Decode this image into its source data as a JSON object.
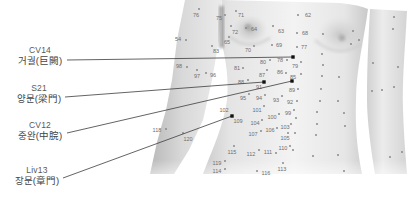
{
  "figure": {
    "annotations": [
      {
        "code": "CV14",
        "name": "거궐(巨闕)"
      },
      {
        "code": "S21",
        "name": "양문(梁門)"
      },
      {
        "code": "CV12",
        "name": "중완(中脘)"
      },
      {
        "code": "Liv13",
        "name": "장문(章門)"
      }
    ],
    "point_numbers": [
      "76",
      "54",
      "98",
      "97",
      "96",
      "118",
      "120",
      "75",
      "71",
      "72",
      "64",
      "65",
      "83",
      "63",
      "62",
      "68",
      "69",
      "77",
      "70",
      "80",
      "78",
      "79",
      "81",
      "87",
      "86",
      "85",
      "88",
      "91",
      "89",
      "95",
      "94",
      "93",
      "92",
      "101",
      "102",
      "100",
      "99",
      "109",
      "104",
      "103",
      "106",
      "107",
      "105",
      "110",
      "115",
      "112",
      "111",
      "113",
      "119",
      "114",
      "116"
    ],
    "colors": {
      "marker": "#111111",
      "leader_line": "#3c3c3c",
      "point_dot": "#8a8a8a",
      "point_number": "#6e6e6e",
      "label_text": "#444444"
    }
  }
}
